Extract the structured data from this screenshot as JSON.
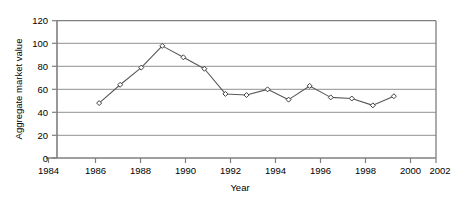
{
  "chart_data": {
    "type": "line",
    "title": "",
    "xlabel": "Year",
    "ylabel": "Aggregate market value",
    "xlim": [
      1984,
      2002
    ],
    "ylim": [
      0,
      120
    ],
    "xticks": [
      1984,
      1986,
      1988,
      1990,
      1992,
      1994,
      1996,
      1998,
      2000,
      2002
    ],
    "yticks": [
      0,
      20,
      40,
      60,
      80,
      100,
      120
    ],
    "grid": "horizontal",
    "legend": "none",
    "marker": "diamond-open",
    "line_color": "#595959",
    "marker_color": "#404040",
    "grid_color": "#a6a6a6",
    "axis_color": "#7f7f7f",
    "background": "#ffffff",
    "x": [
      1986,
      1987,
      1988,
      1989,
      1990,
      1991,
      1992,
      1993,
      1994,
      1995,
      1996,
      1997,
      1998,
      1999,
      2000
    ],
    "values": [
      48,
      64,
      79,
      98,
      88,
      78,
      56,
      55,
      60,
      51,
      63,
      53,
      52,
      46,
      54
    ],
    "series": [
      {
        "name": "Aggregate market value",
        "values": [
          48,
          64,
          79,
          98,
          88,
          78,
          56,
          55,
          60,
          51,
          63,
          53,
          52,
          46,
          54
        ]
      }
    ]
  },
  "axes": {
    "y_tick_labels": [
      "120",
      "100",
      "80",
      "60",
      "40",
      "20",
      "0"
    ],
    "x_tick_labels": [
      "1984",
      "1986",
      "1988",
      "1990",
      "1992",
      "1994",
      "1996",
      "1998",
      "2000",
      "2002"
    ],
    "y_title": "Aggregate market value",
    "x_title": "Year"
  }
}
